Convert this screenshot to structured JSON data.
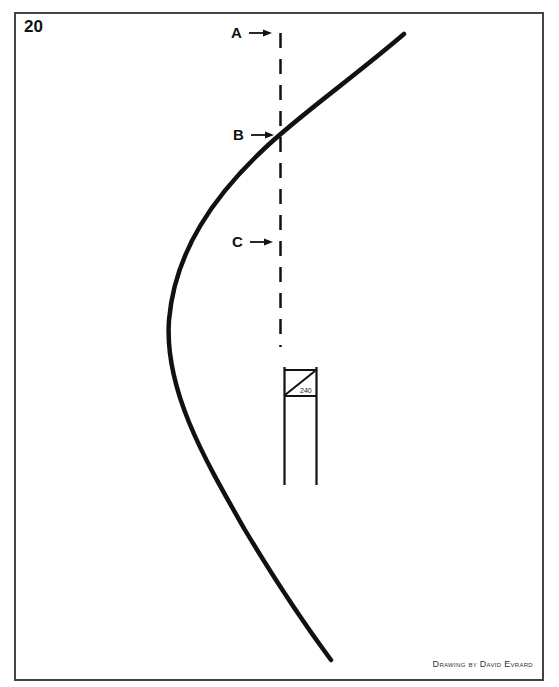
{
  "figure": {
    "number": "20",
    "credit": "Drawing by David Evrard"
  },
  "markers": [
    {
      "label": "A",
      "target": "dashed-line-point-a"
    },
    {
      "label": "B",
      "target": "dashed-line-point-b"
    },
    {
      "label": "C",
      "target": "dashed-line-point-c"
    }
  ],
  "sign": {
    "number": "240"
  },
  "colors": {
    "ink": "#111111",
    "frame": "#444444",
    "background": "#ffffff"
  }
}
